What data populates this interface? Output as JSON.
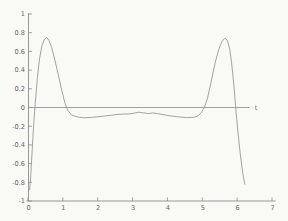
{
  "figure": {
    "background_color": "#f9f9f6",
    "axis_color": "#8c8c8c",
    "curve_color": "#979797",
    "label_color": "#666666"
  },
  "chart_data": {
    "type": "line",
    "title": "",
    "xlabel": "t",
    "ylabel": "",
    "xlim": [
      0,
      7
    ],
    "ylim": [
      -1,
      1
    ],
    "grid": false,
    "legend": "none",
    "axes_style": "L-shaped axes, ticks inward, no box frame",
    "xticks": [
      0,
      1,
      2,
      3,
      4,
      5,
      6,
      7
    ],
    "xtick_labels": [
      "0",
      "1",
      "2",
      "3",
      "4",
      "5",
      "6",
      "7"
    ],
    "yticks": [
      1,
      0.8,
      0.6,
      0.4,
      0.2,
      0,
      -0.2,
      -0.4,
      -0.6,
      -0.8,
      -1
    ],
    "ytick_labels": [
      "1",
      "0.8",
      "0.6",
      "0.4",
      "0.2",
      "0",
      "-0.2",
      "-0.4",
      "-0.6",
      "-0.8",
      "-1"
    ],
    "zero_axis_line": {
      "y": 0,
      "x_start": 0,
      "x_end": 6.35,
      "label": "t"
    },
    "series": [
      {
        "name": "curve",
        "points": [
          [
            0.05,
            -0.88
          ],
          [
            0.08,
            -0.72
          ],
          [
            0.12,
            -0.45
          ],
          [
            0.17,
            -0.15
          ],
          [
            0.21,
            0.05
          ],
          [
            0.27,
            0.32
          ],
          [
            0.33,
            0.52
          ],
          [
            0.4,
            0.66
          ],
          [
            0.47,
            0.73
          ],
          [
            0.53,
            0.75
          ],
          [
            0.6,
            0.72
          ],
          [
            0.68,
            0.64
          ],
          [
            0.77,
            0.51
          ],
          [
            0.87,
            0.35
          ],
          [
            0.97,
            0.18
          ],
          [
            1.06,
            0.05
          ],
          [
            1.14,
            -0.03
          ],
          [
            1.25,
            -0.08
          ],
          [
            1.4,
            -0.1
          ],
          [
            1.6,
            -0.11
          ],
          [
            1.85,
            -0.105
          ],
          [
            2.1,
            -0.095
          ],
          [
            2.35,
            -0.085
          ],
          [
            2.55,
            -0.075
          ],
          [
            2.75,
            -0.07
          ],
          [
            2.9,
            -0.07
          ],
          [
            3.05,
            -0.06
          ],
          [
            3.18,
            -0.05
          ],
          [
            3.32,
            -0.058
          ],
          [
            3.45,
            -0.065
          ],
          [
            3.58,
            -0.058
          ],
          [
            3.72,
            -0.065
          ],
          [
            3.9,
            -0.078
          ],
          [
            4.1,
            -0.09
          ],
          [
            4.3,
            -0.1
          ],
          [
            4.55,
            -0.108
          ],
          [
            4.75,
            -0.105
          ],
          [
            4.88,
            -0.09
          ],
          [
            4.98,
            -0.05
          ],
          [
            5.06,
            0.0
          ],
          [
            5.15,
            0.1
          ],
          [
            5.25,
            0.27
          ],
          [
            5.37,
            0.48
          ],
          [
            5.48,
            0.63
          ],
          [
            5.57,
            0.71
          ],
          [
            5.65,
            0.74
          ],
          [
            5.72,
            0.72
          ],
          [
            5.79,
            0.62
          ],
          [
            5.85,
            0.45
          ],
          [
            5.91,
            0.22
          ],
          [
            5.96,
            0.0
          ],
          [
            6.02,
            -0.25
          ],
          [
            6.09,
            -0.5
          ],
          [
            6.16,
            -0.7
          ],
          [
            6.22,
            -0.82
          ]
        ]
      }
    ]
  }
}
